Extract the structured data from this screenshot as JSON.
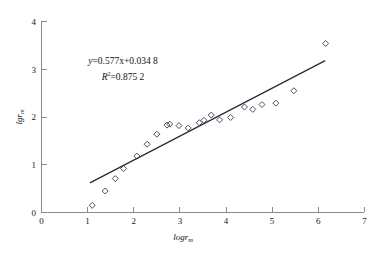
{
  "chart_data": {
    "type": "scatter",
    "title": "",
    "subtitle": "",
    "xlabel": "logr",
    "xlabel_sub": "m",
    "ylabel": "lgr",
    "ylabel_sub": "m",
    "xlim": [
      0,
      7
    ],
    "ylim": [
      0,
      4
    ],
    "xticks": [
      "0",
      "1",
      "2",
      "3",
      "4",
      "5",
      "6",
      "7"
    ],
    "xtick_values": [
      0,
      1,
      2,
      3,
      4,
      5,
      6,
      7
    ],
    "yticks": [
      "0",
      "1",
      "2",
      "3",
      "4"
    ],
    "ytick_values": [
      0,
      1,
      2,
      3,
      4
    ],
    "grid": false,
    "legend": false,
    "legend_position": "none",
    "marker_shape": "open-diamond",
    "marker_color": "#3b3b52",
    "line_color": "#2a2a35",
    "points": [
      {
        "x": 1.1,
        "y": 0.15
      },
      {
        "x": 1.38,
        "y": 0.45
      },
      {
        "x": 1.6,
        "y": 0.71
      },
      {
        "x": 1.78,
        "y": 0.92
      },
      {
        "x": 2.07,
        "y": 1.18
      },
      {
        "x": 2.29,
        "y": 1.43
      },
      {
        "x": 2.5,
        "y": 1.64
      },
      {
        "x": 2.72,
        "y": 1.83
      },
      {
        "x": 2.78,
        "y": 1.85
      },
      {
        "x": 2.98,
        "y": 1.82
      },
      {
        "x": 3.18,
        "y": 1.77
      },
      {
        "x": 3.42,
        "y": 1.88
      },
      {
        "x": 3.52,
        "y": 1.93
      },
      {
        "x": 3.68,
        "y": 2.04
      },
      {
        "x": 3.86,
        "y": 1.94
      },
      {
        "x": 4.1,
        "y": 1.99
      },
      {
        "x": 4.4,
        "y": 2.21
      },
      {
        "x": 4.58,
        "y": 2.16
      },
      {
        "x": 4.78,
        "y": 2.26
      },
      {
        "x": 5.08,
        "y": 2.29
      },
      {
        "x": 5.47,
        "y": 2.55
      },
      {
        "x": 6.16,
        "y": 3.54
      }
    ],
    "fit_line": {
      "slope": 0.577,
      "intercept": 0.0348,
      "x_start": 1.05,
      "x_end": 6.15,
      "y_start": 0.62,
      "y_end": 3.18
    },
    "annotations": {
      "equation_lhs": "y",
      "equation_rhs": "=0.577x+0.034 8",
      "equation": "y=0.577x+0.034 8",
      "r_squared_lhs": "R",
      "r_squared_sup": "2",
      "r_squared_rhs": "=0.875 2",
      "r_squared": "R2=0.875 2"
    }
  }
}
